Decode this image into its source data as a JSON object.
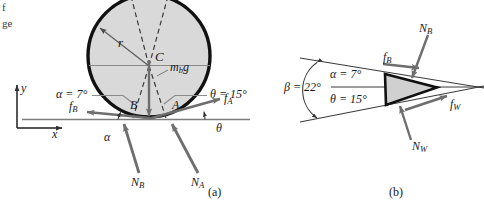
{
  "figure": {
    "page_edge_fragments": [
      "f",
      "ge"
    ],
    "captions": {
      "left": "(a)",
      "right": "(b)"
    },
    "colors": {
      "ink": "#1a1a1a",
      "body_fill": "#d9d9d9",
      "arrow_gray": "#6e6e6e",
      "thin_line": "#8a8a8a",
      "outline": "#111111"
    }
  },
  "axes": {
    "y_label": "y",
    "x_label": "x"
  },
  "panel_a": {
    "caption": "(a)",
    "body_label": "C",
    "radius_label": "r",
    "weight_label": {
      "base": "m",
      "sub": "b",
      "tail": "g"
    },
    "contact_points": [
      "B",
      "A"
    ],
    "angle_left": {
      "symbol": "α",
      "equals": "=",
      "value": "7°",
      "text": "α = 7°"
    },
    "angle_right": {
      "symbol": "θ",
      "equals": "=",
      "value": "15°",
      "text": "θ = 15°"
    },
    "angle_arc_left": "α",
    "angle_arc_right": "θ",
    "forces": [
      {
        "name": "friction-left",
        "base": "f",
        "sub": "B"
      },
      {
        "name": "friction-right",
        "base": "f",
        "sub": "A"
      },
      {
        "name": "normal-left",
        "base": "N",
        "sub": "B"
      },
      {
        "name": "normal-right",
        "base": "N",
        "sub": "A"
      }
    ]
  },
  "panel_b": {
    "caption": "(b)",
    "angle_total": {
      "symbol": "β",
      "equals": "=",
      "value": "22°",
      "text": "β = 22°"
    },
    "angle_upper": {
      "symbol": "α",
      "equals": "=",
      "value": "7°",
      "text": "α = 7°"
    },
    "angle_lower": {
      "symbol": "θ",
      "equals": "=",
      "value": "15°",
      "text": "θ = 15°"
    },
    "forces": [
      {
        "name": "normal-ball",
        "base": "N",
        "sub": "B"
      },
      {
        "name": "friction-ball",
        "base": "f",
        "sub": "B"
      },
      {
        "name": "friction-wall",
        "base": "f",
        "sub": "W"
      },
      {
        "name": "normal-wall",
        "base": "N",
        "sub": "W"
      }
    ]
  }
}
